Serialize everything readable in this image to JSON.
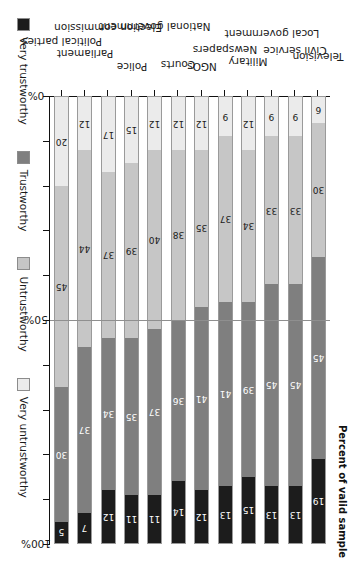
{
  "chart_data": {
    "type": "bar",
    "orientation": "stacked-horizontal-rotated",
    "title": "",
    "xlabel": "",
    "ylabel": "Percent of valid sample",
    "xlim": [
      0,
      100
    ],
    "grid": false,
    "legend_position": "top",
    "reference_line": 50,
    "categories": [
      "Television",
      "Civil service",
      "Local government",
      "Military",
      "Newspapers",
      "NGOs",
      "Courts",
      "National government",
      "Police",
      "Election commission",
      "Parliament",
      "Political parties"
    ],
    "series": [
      {
        "name": "Very untrustworthy",
        "color": "#ebebeb",
        "values": [
          6,
          9,
          9,
          12,
          9,
          12,
          12,
          12,
          15,
          17,
          12,
          20
        ]
      },
      {
        "name": "Untrustworthy",
        "color": "#c6c6c6",
        "values": [
          30,
          33,
          33,
          34,
          37,
          35,
          38,
          40,
          39,
          37,
          44,
          45
        ]
      },
      {
        "name": "Trustworthy",
        "color": "#7f7f7f",
        "values": [
          45,
          45,
          45,
          39,
          41,
          41,
          36,
          37,
          35,
          34,
          37,
          30
        ]
      },
      {
        "name": "Very trustworthy",
        "color": "#1c1c1c",
        "values": [
          19,
          13,
          13,
          15,
          13,
          12,
          14,
          11,
          11,
          12,
          7,
          5
        ]
      }
    ],
    "tick_values": [
      0,
      10,
      20,
      30,
      40,
      50,
      60,
      70,
      80,
      90,
      100
    ],
    "tick_labels": [
      {
        "value": 0,
        "label": "0%"
      },
      {
        "value": 50,
        "label": "50%"
      },
      {
        "value": 100,
        "label": "100%"
      }
    ]
  },
  "legend": {
    "entries": [
      {
        "label": "Very trustworthy",
        "color": "#1c1c1c",
        "text_color": "#ffffff"
      },
      {
        "label": "Trustworthy",
        "color": "#7f7f7f",
        "text_color": "#ffffff"
      },
      {
        "label": "Untrustworthy",
        "color": "#c6c6c6",
        "text_color": "#1a1a1a"
      },
      {
        "label": "Very untrustworthy",
        "color": "#ebebeb",
        "text_color": "#1a1a1a"
      }
    ]
  },
  "axis": {
    "value_axis_title": "Percent of valid sample"
  }
}
